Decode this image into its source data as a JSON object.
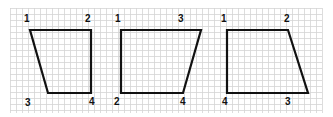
{
  "grid": {
    "x": 10,
    "y": 8,
    "width": 312,
    "height": 105,
    "cell": 6,
    "line_color": "#d4d4d4"
  },
  "stroke_color": "#111111",
  "shapes": [
    {
      "name": "quad-1",
      "points": [
        [
          30,
          30
        ],
        [
          91,
          30
        ],
        [
          91,
          93
        ],
        [
          48,
          93
        ]
      ],
      "labels": [
        {
          "text": "1",
          "x": 24,
          "y": 22
        },
        {
          "text": "2",
          "x": 85,
          "y": 22
        },
        {
          "text": "3",
          "x": 25,
          "y": 106
        },
        {
          "text": "4",
          "x": 89,
          "y": 105
        }
      ]
    },
    {
      "name": "quad-2",
      "points": [
        [
          121,
          30
        ],
        [
          201,
          30
        ],
        [
          183,
          93
        ],
        [
          121,
          93
        ]
      ],
      "labels": [
        {
          "text": "1",
          "x": 115,
          "y": 22
        },
        {
          "text": "3",
          "x": 178,
          "y": 22
        },
        {
          "text": "2",
          "x": 114,
          "y": 105
        },
        {
          "text": "4",
          "x": 180,
          "y": 105
        }
      ]
    },
    {
      "name": "quad-3",
      "points": [
        [
          227,
          30
        ],
        [
          288,
          30
        ],
        [
          308,
          93
        ],
        [
          227,
          93
        ]
      ],
      "labels": [
        {
          "text": "1",
          "x": 221,
          "y": 22
        },
        {
          "text": "2",
          "x": 284,
          "y": 22
        },
        {
          "text": "4",
          "x": 222,
          "y": 105
        },
        {
          "text": "3",
          "x": 285,
          "y": 105
        }
      ]
    }
  ]
}
